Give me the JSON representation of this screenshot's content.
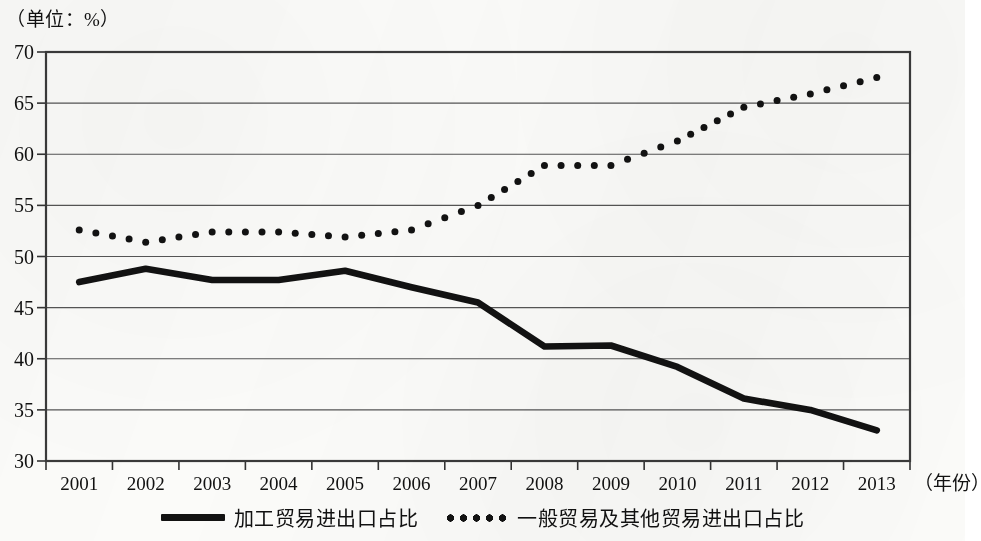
{
  "chart_data": {
    "type": "line",
    "title": "",
    "unit_note": "（单位：%）",
    "xlabel": "（年份）",
    "ylabel": "",
    "categories": [
      "2001",
      "2002",
      "2003",
      "2004",
      "2005",
      "2006",
      "2007",
      "2008",
      "2009",
      "2010",
      "2011",
      "2012",
      "2013"
    ],
    "ylim": [
      30,
      70
    ],
    "yticks": [
      "30",
      "35",
      "40",
      "45",
      "50",
      "55",
      "60",
      "65",
      "70"
    ],
    "grid": true,
    "legend_position": "bottom",
    "series": [
      {
        "name": "加工贸易进出口占比",
        "style": "solid",
        "color": "#121212",
        "values": [
          47.5,
          48.8,
          47.7,
          47.7,
          48.6,
          47.0,
          45.5,
          41.2,
          41.3,
          39.2,
          36.1,
          35.0,
          33.0
        ]
      },
      {
        "name": "一般贸易及其他贸易进出口占比",
        "style": "dotted",
        "color": "#121212",
        "values": [
          52.6,
          51.4,
          52.4,
          52.4,
          51.9,
          52.6,
          55.0,
          58.9,
          58.9,
          61.3,
          64.6,
          65.9,
          67.5
        ]
      }
    ]
  },
  "axis": {
    "unit_note": "（单位：%）",
    "x_title": "（年份）"
  }
}
